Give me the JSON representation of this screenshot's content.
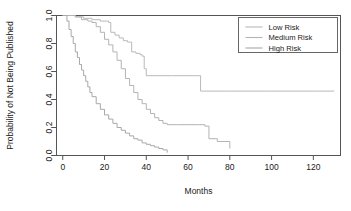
{
  "chart_data": {
    "type": "line",
    "title": "",
    "xlabel": "Months",
    "ylabel": "Probability of Not Being Published",
    "xlim": [
      -3,
      133
    ],
    "ylim": [
      0.0,
      1.0
    ],
    "xticks": [
      0,
      20,
      40,
      60,
      80,
      100,
      120
    ],
    "xticklabels": [
      "0",
      "20",
      "40",
      "60",
      "80",
      "100",
      "120"
    ],
    "yticks": [
      0.0,
      0.2,
      0.4,
      0.6,
      0.8,
      1.0
    ],
    "yticklabels": [
      "0.0",
      "0.2",
      "0.4",
      "0.6",
      "0.8",
      "1.0"
    ],
    "grid": false,
    "legend_position": "top-right",
    "step_type": "post",
    "series": [
      {
        "name": "Low Risk",
        "color": "#b9b9b9",
        "x": [
          0,
          2,
          6,
          10,
          14,
          18,
          22,
          23,
          25,
          27,
          29,
          31,
          33,
          35,
          37,
          38,
          39,
          40,
          52,
          63,
          66,
          80,
          100,
          120,
          130
        ],
        "y": [
          1.0,
          1.0,
          0.99,
          0.98,
          0.97,
          0.96,
          0.95,
          0.88,
          0.86,
          0.84,
          0.82,
          0.81,
          0.74,
          0.73,
          0.72,
          0.71,
          0.62,
          0.57,
          0.57,
          0.57,
          0.46,
          0.46,
          0.46,
          0.46,
          0.46
        ]
      },
      {
        "name": "Medium Risk",
        "color": "#b3b3b3",
        "x": [
          0,
          3,
          6,
          9,
          12,
          14,
          16,
          18,
          20,
          22,
          24,
          26,
          28,
          30,
          32,
          34,
          36,
          38,
          40,
          42,
          44,
          46,
          48,
          50,
          55,
          60,
          65,
          68,
          70,
          74,
          80
        ],
        "y": [
          1.0,
          1.0,
          0.99,
          0.97,
          0.96,
          0.95,
          0.92,
          0.88,
          0.83,
          0.79,
          0.74,
          0.68,
          0.62,
          0.55,
          0.5,
          0.45,
          0.4,
          0.37,
          0.33,
          0.3,
          0.27,
          0.25,
          0.23,
          0.22,
          0.22,
          0.22,
          0.22,
          0.21,
          0.12,
          0.1,
          0.05
        ]
      },
      {
        "name": "High Risk",
        "color": "#a8a8a8",
        "x": [
          0,
          1,
          2,
          3,
          4,
          5,
          6,
          7,
          8,
          9,
          10,
          11,
          12,
          13,
          14,
          16,
          18,
          20,
          22,
          24,
          26,
          28,
          30,
          32,
          34,
          36,
          38,
          40,
          42,
          44,
          46,
          48,
          50
        ],
        "y": [
          1.0,
          1.0,
          0.96,
          0.9,
          0.85,
          0.8,
          0.74,
          0.7,
          0.65,
          0.61,
          0.57,
          0.53,
          0.49,
          0.45,
          0.42,
          0.37,
          0.33,
          0.29,
          0.26,
          0.23,
          0.2,
          0.18,
          0.16,
          0.14,
          0.12,
          0.11,
          0.09,
          0.08,
          0.07,
          0.06,
          0.05,
          0.04,
          0.02
        ]
      }
    ]
  },
  "legend": {
    "items": [
      {
        "label": "Low Risk",
        "color": "#b9b9b9"
      },
      {
        "label": "Medium Risk",
        "color": "#b3b3b3"
      },
      {
        "label": "High Risk",
        "color": "#a8a8a8"
      }
    ]
  },
  "axes": {
    "x_title": "Months",
    "y_title": "Probability of Not Being Published"
  }
}
